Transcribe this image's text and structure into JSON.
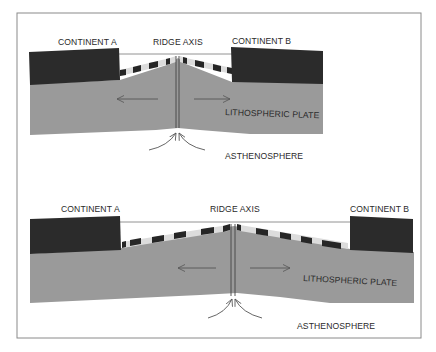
{
  "colors": {
    "frame": "#8a8a8a",
    "continent": "#2b2b2b",
    "plate": "#9a9a9a",
    "stripe_dark": "#262626",
    "stripe_light": "#dcdcdc",
    "line": "#555555",
    "text": "#2a2a2a",
    "background": "#ffffff"
  },
  "panels": [
    {
      "id": "top",
      "labels": {
        "continent_a": "CONTINENT A",
        "ridge_axis": "RIDGE AXIS",
        "continent_b": "CONTINENT B",
        "lithospheric_plate": "LITHOSPHERIC PLATE",
        "asthenosphere": "ASTHENOSPHERE"
      },
      "arrows": [
        "left",
        "right",
        "upwelling"
      ]
    },
    {
      "id": "bottom",
      "labels": {
        "continent_a": "CONTINENT A",
        "ridge_axis": "RIDGE AXIS",
        "continent_b": "CONTINENT B",
        "lithospheric_plate": "LITHOSPHERIC PLATE",
        "asthenosphere": "ASTHENOSPHERE"
      },
      "arrows": [
        "left",
        "right",
        "upwelling"
      ]
    }
  ]
}
